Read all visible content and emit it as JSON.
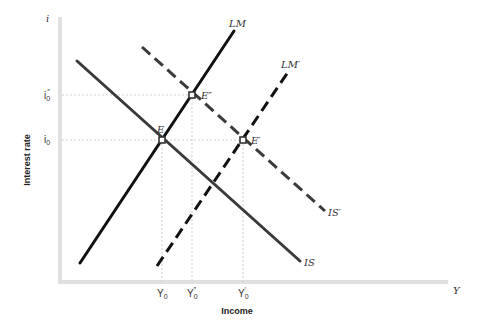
{
  "diagram": {
    "y_axis": {
      "symbol": "i",
      "label": "Interest rate"
    },
    "x_axis": {
      "symbol": "Y",
      "label": "Income"
    },
    "y_ticks": [
      {
        "base": "i",
        "sub": "0",
        "sup": "″",
        "id": "i0-double-prime"
      },
      {
        "base": "i",
        "sub": "0",
        "sup": "",
        "id": "i0"
      }
    ],
    "x_ticks": [
      {
        "base": "Y",
        "sub": "0",
        "sup": "",
        "id": "Y0"
      },
      {
        "base": "Y",
        "sub": "0",
        "sup": "″",
        "id": "Y0-double-prime"
      },
      {
        "base": "Y",
        "sub": "0",
        "sup": "′",
        "id": "Y0-prime"
      }
    ],
    "curves": [
      {
        "name": "LM",
        "style": "solid",
        "color": "#111111"
      },
      {
        "name": "LM′",
        "style": "dashed",
        "color": "#111111"
      },
      {
        "name": "IS",
        "style": "solid",
        "color": "#3a3a3a"
      },
      {
        "name": "IS′",
        "style": "dashed",
        "color": "#3a3a3a"
      }
    ],
    "points": [
      {
        "name": "E",
        "description": "IS ∩ LM at (Y0, i0)"
      },
      {
        "name": "E′",
        "description": "IS′ ∩ LM′ at (Y0′, i0)"
      },
      {
        "name": "E″",
        "description": "IS′ ∩ LM at (Y0″, i0″)"
      }
    ]
  }
}
